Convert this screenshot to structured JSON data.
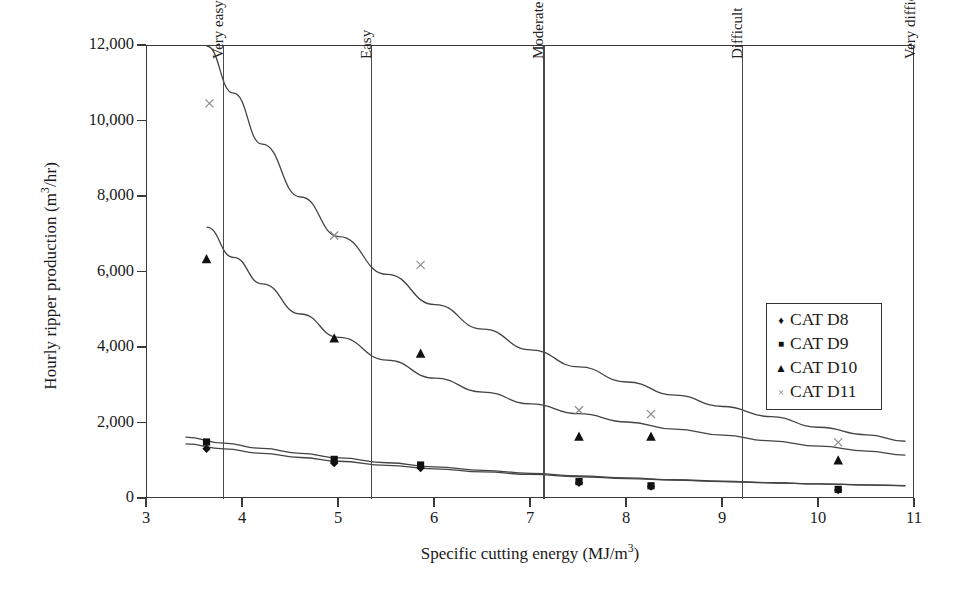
{
  "chart_data": {
    "type": "scatter",
    "title": "",
    "xlabel": "Specific cutting energy (MJ/m3)",
    "ylabel": "Hourly ripper production (m3/hr)",
    "xlim": [
      3,
      11
    ],
    "ylim": [
      0,
      12000
    ],
    "xticks": [
      3,
      4,
      5,
      6,
      7,
      8,
      9,
      10,
      11
    ],
    "xtick_labels": [
      "3",
      "4",
      "5",
      "6",
      "7",
      "8",
      "9",
      "10",
      "11"
    ],
    "yticks": [
      0,
      2000,
      4000,
      6000,
      8000,
      10000,
      12000
    ],
    "ytick_labels": [
      "0",
      "2,000",
      "4,000",
      "6,000",
      "8,000",
      "10,000",
      "12,000"
    ],
    "grid": false,
    "legend_position": "right",
    "series": [
      {
        "name": "CAT D8",
        "marker": "diamond",
        "glyph": "♦",
        "color": "#111111",
        "points": [
          {
            "x": 3.62,
            "y": 1330
          },
          {
            "x": 4.95,
            "y": 950
          },
          {
            "x": 5.85,
            "y": 820
          },
          {
            "x": 7.5,
            "y": 430
          },
          {
            "x": 8.25,
            "y": 330
          },
          {
            "x": 10.2,
            "y": 240
          }
        ]
      },
      {
        "name": "CAT D9",
        "marker": "square",
        "glyph": "■",
        "color": "#111111",
        "points": [
          {
            "x": 3.62,
            "y": 1510
          },
          {
            "x": 4.95,
            "y": 1050
          },
          {
            "x": 5.85,
            "y": 900
          },
          {
            "x": 7.5,
            "y": 460
          },
          {
            "x": 8.25,
            "y": 350
          },
          {
            "x": 10.2,
            "y": 255
          }
        ]
      },
      {
        "name": "CAT D10",
        "marker": "triangle",
        "glyph": "▲",
        "color": "#111111",
        "points": [
          {
            "x": 3.62,
            "y": 6350
          },
          {
            "x": 4.95,
            "y": 4250
          },
          {
            "x": 5.85,
            "y": 3850
          },
          {
            "x": 7.5,
            "y": 1650
          },
          {
            "x": 8.25,
            "y": 1650
          },
          {
            "x": 10.2,
            "y": 1020
          }
        ]
      },
      {
        "name": "CAT D11",
        "marker": "x",
        "glyph": "×",
        "color": "#8a8a8a",
        "points": [
          {
            "x": 3.65,
            "y": 10480
          },
          {
            "x": 4.95,
            "y": 6980
          },
          {
            "x": 5.85,
            "y": 6200
          },
          {
            "x": 7.5,
            "y": 2350
          },
          {
            "x": 8.25,
            "y": 2250
          },
          {
            "x": 10.2,
            "y": 1500
          }
        ]
      }
    ],
    "trend_curves": [
      {
        "name": "CAT D11 trend",
        "for_series": "CAT D11",
        "points": [
          {
            "x": 3.62,
            "y": 12000
          },
          {
            "x": 3.9,
            "y": 10750
          },
          {
            "x": 4.2,
            "y": 9400
          },
          {
            "x": 4.6,
            "y": 8000
          },
          {
            "x": 5.0,
            "y": 6950
          },
          {
            "x": 5.5,
            "y": 5950
          },
          {
            "x": 6.0,
            "y": 5150
          },
          {
            "x": 6.5,
            "y": 4500
          },
          {
            "x": 7.0,
            "y": 3950
          },
          {
            "x": 7.5,
            "y": 3500
          },
          {
            "x": 8.0,
            "y": 3100
          },
          {
            "x": 8.5,
            "y": 2750
          },
          {
            "x": 9.0,
            "y": 2450
          },
          {
            "x": 9.5,
            "y": 2180
          },
          {
            "x": 10.0,
            "y": 1900
          },
          {
            "x": 10.5,
            "y": 1700
          },
          {
            "x": 10.9,
            "y": 1530
          }
        ]
      },
      {
        "name": "CAT D10 trend",
        "for_series": "CAT D10",
        "points": [
          {
            "x": 3.62,
            "y": 7200
          },
          {
            "x": 3.9,
            "y": 6400
          },
          {
            "x": 4.2,
            "y": 5700
          },
          {
            "x": 4.6,
            "y": 4900
          },
          {
            "x": 5.0,
            "y": 4280
          },
          {
            "x": 5.5,
            "y": 3680
          },
          {
            "x": 6.0,
            "y": 3200
          },
          {
            "x": 6.5,
            "y": 2830
          },
          {
            "x": 7.0,
            "y": 2520
          },
          {
            "x": 7.5,
            "y": 2260
          },
          {
            "x": 8.0,
            "y": 2040
          },
          {
            "x": 8.5,
            "y": 1850
          },
          {
            "x": 9.0,
            "y": 1690
          },
          {
            "x": 9.5,
            "y": 1540
          },
          {
            "x": 10.0,
            "y": 1400
          },
          {
            "x": 10.5,
            "y": 1270
          },
          {
            "x": 10.9,
            "y": 1160
          }
        ]
      },
      {
        "name": "CAT D9 trend",
        "for_series": "CAT D9",
        "points": [
          {
            "x": 3.4,
            "y": 1640
          },
          {
            "x": 3.8,
            "y": 1480
          },
          {
            "x": 4.2,
            "y": 1340
          },
          {
            "x": 4.6,
            "y": 1210
          },
          {
            "x": 5.0,
            "y": 1090
          },
          {
            "x": 5.5,
            "y": 960
          },
          {
            "x": 6.0,
            "y": 850
          },
          {
            "x": 6.5,
            "y": 760
          },
          {
            "x": 7.0,
            "y": 680
          },
          {
            "x": 7.5,
            "y": 615
          },
          {
            "x": 8.0,
            "y": 560
          },
          {
            "x": 8.5,
            "y": 510
          },
          {
            "x": 9.0,
            "y": 470
          },
          {
            "x": 9.5,
            "y": 430
          },
          {
            "x": 10.0,
            "y": 400
          },
          {
            "x": 10.5,
            "y": 370
          },
          {
            "x": 10.9,
            "y": 350
          }
        ]
      },
      {
        "name": "CAT D8 trend",
        "for_series": "CAT D8",
        "points": [
          {
            "x": 3.4,
            "y": 1460
          },
          {
            "x": 3.8,
            "y": 1330
          },
          {
            "x": 4.2,
            "y": 1210
          },
          {
            "x": 4.6,
            "y": 1100
          },
          {
            "x": 5.0,
            "y": 1000
          },
          {
            "x": 5.5,
            "y": 890
          },
          {
            "x": 6.0,
            "y": 800
          },
          {
            "x": 6.5,
            "y": 720
          },
          {
            "x": 7.0,
            "y": 650
          },
          {
            "x": 7.5,
            "y": 590
          },
          {
            "x": 8.0,
            "y": 540
          },
          {
            "x": 8.5,
            "y": 500
          },
          {
            "x": 9.0,
            "y": 460
          },
          {
            "x": 9.5,
            "y": 430
          },
          {
            "x": 10.0,
            "y": 400
          },
          {
            "x": 10.5,
            "y": 375
          },
          {
            "x": 10.9,
            "y": 355
          }
        ]
      }
    ],
    "zones": [
      {
        "label": "Very easy",
        "x_start": 3.0,
        "x_end": 3.79
      },
      {
        "label": "Easy",
        "x_start": 3.79,
        "x_end": 5.33
      },
      {
        "label": "Moderate",
        "x_start": 5.33,
        "x_end": 7.13
      },
      {
        "label": "Difficult",
        "x_start": 7.13,
        "x_end": 9.2
      },
      {
        "label": "Very difficult",
        "x_start": 9.2,
        "x_end": 11.0
      }
    ],
    "zone_dividers": [
      3.79,
      5.33,
      7.13,
      9.2
    ]
  },
  "legend": {
    "entries": [
      {
        "label": "CAT D8",
        "glyph": "♦",
        "cls": "mk-diamond"
      },
      {
        "label": "CAT D9",
        "glyph": "■",
        "cls": "mk-square"
      },
      {
        "label": "CAT D10",
        "glyph": "▲",
        "cls": "mk-tri"
      },
      {
        "label": "CAT D11",
        "glyph": "×",
        "cls": "mk-x"
      }
    ]
  },
  "colors": {
    "axis": "#3a3a3a",
    "marker_dark": "#111111",
    "marker_x": "#8a8a8a",
    "curve": "#444444",
    "divider": "#4a4a4a",
    "background": "#ffffff"
  }
}
